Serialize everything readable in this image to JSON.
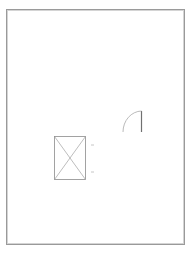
{
  "drawing": {
    "type": "floor-plan",
    "elements": [
      {
        "kind": "room-outline",
        "label": ""
      },
      {
        "kind": "fixture-box-with-cross",
        "label": ""
      },
      {
        "kind": "door-swing",
        "label": ""
      },
      {
        "kind": "dimension-ticks",
        "count": 2
      }
    ]
  },
  "colors": {
    "background": "#ffffff",
    "lines": "#9a9a9a"
  }
}
